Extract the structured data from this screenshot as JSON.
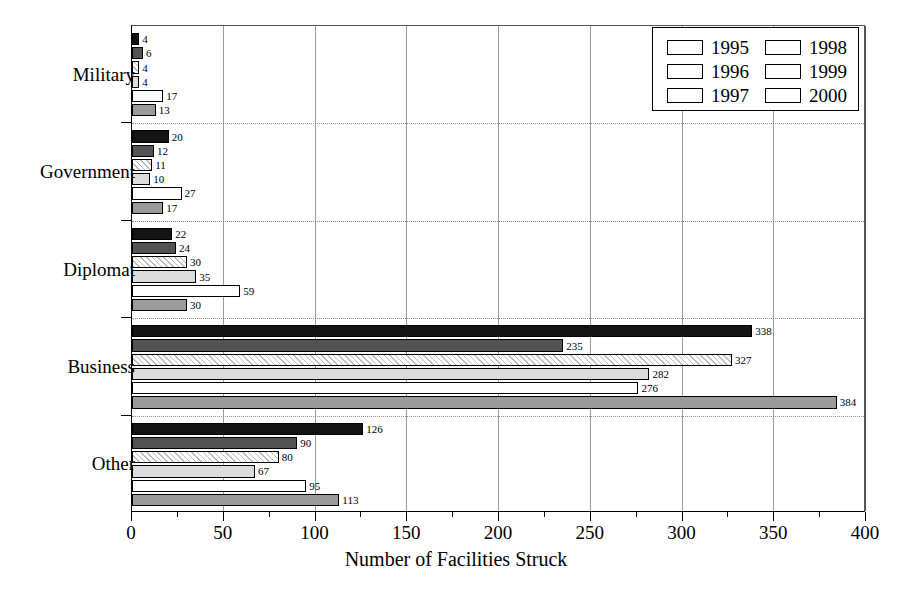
{
  "chart_data": {
    "type": "bar",
    "orientation": "horizontal",
    "title": "",
    "xlabel": "Number of Facilities Struck",
    "ylabel": "",
    "xlim": [
      0,
      400
    ],
    "xticks": [
      0,
      50,
      100,
      150,
      200,
      250,
      300,
      350,
      400
    ],
    "xtick_labels": [
      "0",
      "50",
      "100",
      "150",
      "200",
      "250",
      "300",
      "350",
      "400"
    ],
    "minor_tick_step": 25,
    "grid": "vertical major gridlines plus dotted horizontal group separators",
    "legend_position": "top-right inside plot",
    "categories": [
      "Military",
      "Government",
      "Diplomat",
      "Business",
      "Other"
    ],
    "series": [
      {
        "name": "1995",
        "color": "#141414",
        "pattern": "solid-black",
        "values": [
          4,
          20,
          22,
          338,
          126
        ]
      },
      {
        "name": "1996",
        "color": "#535353",
        "pattern": "solid-dark-gray",
        "values": [
          6,
          12,
          24,
          235,
          90
        ]
      },
      {
        "name": "1997",
        "color": "#ffffff",
        "pattern": "diagonal-hatch",
        "values": [
          4,
          11,
          30,
          327,
          80
        ]
      },
      {
        "name": "1998",
        "color": "#dcdcdc",
        "pattern": "solid-light-gray",
        "values": [
          4,
          10,
          35,
          282,
          67
        ]
      },
      {
        "name": "1999",
        "color": "#ffffff",
        "pattern": "solid-white",
        "values": [
          17,
          27,
          59,
          276,
          95
        ]
      },
      {
        "name": "2000",
        "color": "#9b9b9b",
        "pattern": "solid-medium-gray",
        "values": [
          13,
          17,
          30,
          384,
          113
        ]
      }
    ]
  },
  "axis": {
    "x_title": "Number of Facilities Struck"
  },
  "legend": {
    "entries": [
      {
        "label": "1995"
      },
      {
        "label": "1996"
      },
      {
        "label": "1997"
      },
      {
        "label": "1998"
      },
      {
        "label": "1999"
      },
      {
        "label": "2000"
      }
    ]
  }
}
